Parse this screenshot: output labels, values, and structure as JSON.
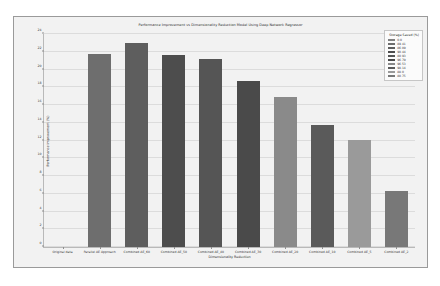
{
  "chart_data": {
    "type": "bar",
    "title": "Performance Improvement vs Dimensionality Reduction Model Using Deep Network Regressor",
    "xlabel": "Dimensionality Reduction",
    "ylabel": "Performance Improvement (%)",
    "ylim": [
      0,
      24
    ],
    "yticks": [
      0,
      2,
      4,
      6,
      8,
      10,
      12,
      14,
      16,
      18,
      20,
      22,
      24
    ],
    "grid": true,
    "categories": [
      "Original data",
      "Parallel AE Approach",
      "Combined AE_60",
      "Combined AE_50",
      "Combined AE_40",
      "Combined AE_30",
      "Combined AE_20",
      "Combined AE_10",
      "Combined AE_5",
      "Combined AE_2"
    ],
    "values": [
      0,
      21.7,
      23.0,
      21.6,
      21.2,
      18.7,
      16.9,
      13.7,
      12.1,
      6.3
    ],
    "bar_colors": [
      "#808080",
      "#6e6e6e",
      "#5e5e5e",
      "#4d4d4d",
      "#555555",
      "#4a4a4a",
      "#8a8a8a",
      "#5a5a5a",
      "#9a9a9a",
      "#787878"
    ],
    "legend": {
      "title": "Storage Saved (%)",
      "position": "upper right",
      "entries": [
        {
          "label": "0.0",
          "color": "#808080"
        },
        {
          "label": "89.41",
          "color": "#6e6e6e"
        },
        {
          "label": "86.09",
          "color": "#5e5e5e"
        },
        {
          "label": "90.44",
          "color": "#4d4d4d"
        },
        {
          "label": "80.93",
          "color": "#555555"
        },
        {
          "label": "96.79",
          "color": "#4a4a4a"
        },
        {
          "label": "96.53",
          "color": "#8a8a8a"
        },
        {
          "label": "98.14",
          "color": "#5a5a5a"
        },
        {
          "label": "88.0",
          "color": "#9a9a9a"
        },
        {
          "label": "80.75",
          "color": "#787878"
        }
      ]
    }
  },
  "figure": {
    "background": "#f2f2f2",
    "border_color": "#9a9a9a"
  }
}
